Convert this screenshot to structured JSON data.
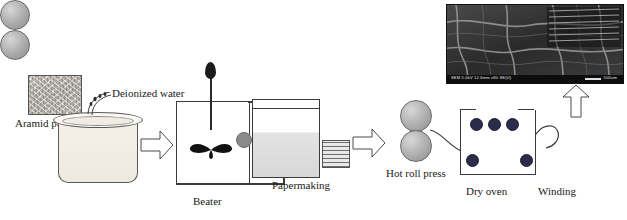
{
  "figure": {
    "background_color": "#ffffff",
    "line_color": "#3b3b3b"
  },
  "labels": {
    "aramid_pulp": "Aramid pulp",
    "deionized_water": "Deionized water",
    "beater": "Beater",
    "papermaking": "Papermaking",
    "hot_roll_press": "Hot roll press",
    "dry_oven": "Dry oven",
    "winding": "Winding"
  },
  "sem": {
    "caption": "SEM 5.0kV  12.6mm x80 SE(U)",
    "scalebar": "500um",
    "background_color": "#151515"
  },
  "nodes": [
    {
      "id": "pulp-swatch",
      "name": "aramid-pulp-swatch",
      "kind": "material-sample"
    },
    {
      "id": "beaker",
      "name": "pulp-beaker",
      "kind": "vessel"
    },
    {
      "id": "water-spray",
      "name": "deionized-water-spray",
      "kind": "fluid-input"
    },
    {
      "id": "beater-tank",
      "name": "beater-tank",
      "kind": "equipment"
    },
    {
      "id": "paper-tank",
      "name": "papermaking-tank",
      "kind": "equipment"
    },
    {
      "id": "mesh-screen",
      "name": "papermaking-mesh-screen",
      "kind": "component"
    },
    {
      "id": "hot-roll-press",
      "name": "hot-roll-press",
      "kind": "equipment"
    },
    {
      "id": "dry-oven",
      "name": "dry-oven",
      "kind": "equipment"
    },
    {
      "id": "winding",
      "name": "winding-rollers",
      "kind": "equipment"
    },
    {
      "id": "sem-image",
      "name": "sem-micrograph",
      "kind": "image"
    }
  ],
  "arrows": [
    {
      "id": "arrow-1",
      "name": "arrow-pulp-to-beater",
      "direction": "right"
    },
    {
      "id": "arrow-2",
      "name": "arrow-papermaking-to-hotroll",
      "direction": "right"
    },
    {
      "id": "arrow-3",
      "name": "arrow-winding-to-sem",
      "direction": "up"
    }
  ]
}
